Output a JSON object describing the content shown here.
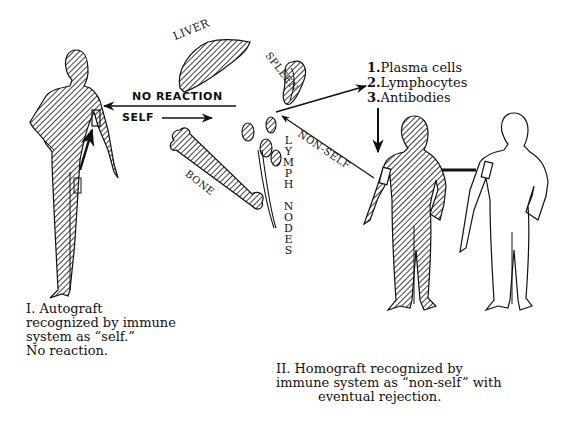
{
  "figure": {
    "type": "diagram"
  },
  "organs": {
    "liver": "LIVER",
    "spleen": "SPLEEN",
    "bone": "BONE",
    "lymph_nodes": "LYMPH NODES"
  },
  "arrows": {
    "no_reaction": "NO REACTION",
    "self": "SELF",
    "non_self": "NON-SELF"
  },
  "immune_response": {
    "items": [
      {
        "num": "1.",
        "label": "Plasma cells"
      },
      {
        "num": "2.",
        "label": "Lymphocytes"
      },
      {
        "num": "3.",
        "label": "Antibodies"
      }
    ]
  },
  "captions": {
    "autograft": {
      "line1": "I. Autograft",
      "line2": "recognized by immune",
      "line3": "system as “self.”",
      "line4": "No reaction."
    },
    "homograft": {
      "line1": "II. Homograft recognized by",
      "line2": "immune system as “non-self” with",
      "line3": "eventual rejection."
    }
  },
  "colors": {
    "ink": "#111111",
    "background": "#ffffff"
  }
}
